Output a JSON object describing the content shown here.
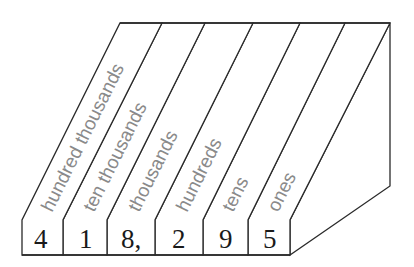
{
  "diagram": {
    "columns": [
      {
        "place": "hundred thousands",
        "digit": "4"
      },
      {
        "place": "ten thousands",
        "digit": "1"
      },
      {
        "place": "thousands",
        "digit": "8,"
      },
      {
        "place": "hundreds",
        "digit": "2"
      },
      {
        "place": "tens",
        "digit": "9"
      },
      {
        "place": "ones",
        "digit": "5"
      }
    ],
    "number": "418,295",
    "colors": {
      "line": "#2a2a2a",
      "label": "#8a8a8a",
      "digit": "#1a1a1a",
      "background": "#ffffff"
    }
  }
}
